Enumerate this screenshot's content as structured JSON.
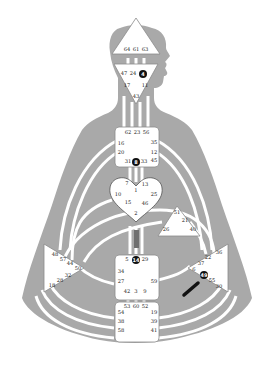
{
  "colors": {
    "body": "#a9a9a9",
    "channel": "#ffffff",
    "center_fill": "#ffffff",
    "center_stroke": "#8a8a8a",
    "activated": "#111111",
    "text": "#1a1a1a"
  },
  "centers": {
    "head": {
      "gates": [
        "64",
        "61",
        "63"
      ]
    },
    "ajna": {
      "gates": [
        "47",
        "24",
        "4",
        "17",
        "11",
        "43"
      ],
      "highlighted": [
        "4"
      ]
    },
    "throat": {
      "gates": [
        "62",
        "23",
        "56",
        "16",
        "35",
        "20",
        "12",
        "31",
        "8",
        "33",
        "45"
      ],
      "highlighted": [
        "8"
      ]
    },
    "g": {
      "gates": [
        "7",
        "1",
        "13",
        "10",
        "25",
        "15",
        "46",
        "2"
      ]
    },
    "ego": {
      "gates": [
        "51",
        "21",
        "26",
        "40"
      ]
    },
    "sacral": {
      "gates": [
        "5",
        "14",
        "29",
        "34",
        "27",
        "59",
        "42",
        "3",
        "9"
      ],
      "highlighted": [
        "14"
      ]
    },
    "root": {
      "gates": [
        "53",
        "60",
        "52",
        "54",
        "38",
        "58",
        "19",
        "39",
        "41"
      ]
    },
    "spleen": {
      "gates": [
        "48",
        "57",
        "44",
        "50",
        "32",
        "28",
        "18"
      ]
    },
    "solar_plexus": {
      "gates": [
        "36",
        "22",
        "37",
        "6",
        "49",
        "55",
        "30"
      ],
      "highlighted": [
        "49"
      ]
    }
  }
}
